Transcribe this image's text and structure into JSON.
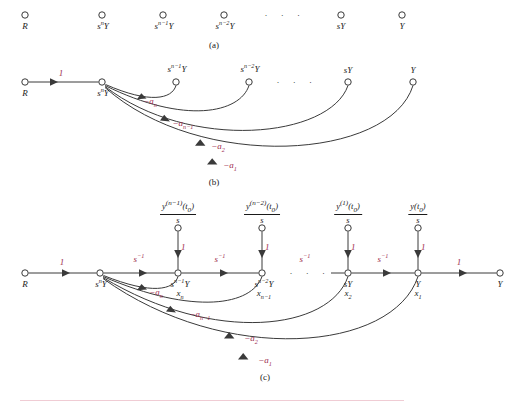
{
  "figure": {
    "title_caption_a": "(a)",
    "title_caption_b": "(b)",
    "title_caption_c": "(c)",
    "colors": {
      "ink": "#3a3a3a",
      "text": "#1a1a1a",
      "gain_red": "#9e2b4e",
      "rule_pink": "#f0ccd4"
    },
    "ellipsis": "· · ·"
  },
  "panel_a": {
    "caption": "(a)",
    "nodes": [
      {
        "id": "R",
        "label_base": "R",
        "label_sup": "",
        "label_sub": "",
        "x": 25,
        "y": 15
      },
      {
        "id": "snY",
        "label_base": "s",
        "label_sup": "n",
        "label_tail": "Y",
        "x": 102,
        "y": 15
      },
      {
        "id": "sn1Y",
        "label_base": "s",
        "label_sup": "n−1",
        "label_tail": "Y",
        "x": 163,
        "y": 15
      },
      {
        "id": "sn2Y",
        "label_base": "s",
        "label_sup": "n−2",
        "label_tail": "Y",
        "x": 224,
        "y": 15
      },
      {
        "id": "sY",
        "label_base": "sY",
        "label_sup": "",
        "label_tail": "",
        "x": 341,
        "y": 15
      },
      {
        "id": "Y",
        "label_base": "Y",
        "label_sup": "",
        "label_tail": "",
        "x": 402,
        "y": 15
      }
    ],
    "ellipsis_x": 285,
    "ellipsis_y": 13
  },
  "panel_b": {
    "caption": "(b)",
    "nodes": [
      {
        "id": "R",
        "label": "R",
        "x": 25,
        "y": 82
      },
      {
        "id": "snY",
        "label": "snY",
        "x": 102,
        "y": 82
      },
      {
        "id": "sn1Y",
        "label": "sn1Y",
        "x": 176,
        "y": 82
      },
      {
        "id": "sn2Y",
        "label": "sn2Y",
        "x": 249,
        "y": 82
      },
      {
        "id": "sY",
        "label": "sY",
        "x": 348,
        "y": 82
      },
      {
        "id": "Y",
        "label": "Y",
        "x": 413,
        "y": 82
      }
    ],
    "forward_gain": "1",
    "feedback_gains": [
      "−a",
      "−a",
      "−a",
      "−a"
    ],
    "feedback_labels": [
      {
        "base": "−a",
        "sub": "n",
        "x": 147,
        "y": 101
      },
      {
        "base": "−a",
        "sub": "n−1",
        "x": 180,
        "y": 122
      },
      {
        "base": "−a",
        "sub": "2",
        "x": 215,
        "y": 143
      },
      {
        "base": "−a",
        "sub": "1",
        "x": 226,
        "y": 162
      }
    ],
    "ellipsis_x": 297,
    "ellipsis_y": 80
  },
  "panel_c": {
    "caption": "(c)",
    "nodes": [
      {
        "id": "R",
        "x": 25,
        "y": 273,
        "label_base": "R",
        "label_sup": "",
        "label_tail": "",
        "state": ""
      },
      {
        "id": "snY",
        "x": 100,
        "y": 273,
        "label_base": "s",
        "label_sup": "n",
        "label_tail": "Y",
        "state": ""
      },
      {
        "id": "sn1Y",
        "x": 178,
        "y": 273,
        "label_base": "s",
        "label_sup": "n−1",
        "label_tail": "Y",
        "state": "x",
        "state_sub": "n"
      },
      {
        "id": "sn2Y",
        "x": 262,
        "y": 273,
        "label_base": "s",
        "label_sup": "n−2",
        "label_tail": "Y",
        "state": "x",
        "state_sub": "n−1"
      },
      {
        "id": "sY",
        "x": 348,
        "y": 273,
        "label_base": "sY",
        "label_sup": "",
        "label_tail": "",
        "state": "x",
        "state_sub": "2"
      },
      {
        "id": "Y",
        "x": 418,
        "y": 273,
        "label_base": "Y",
        "label_sup": "",
        "label_tail": "",
        "state": "x",
        "state_sub": "1"
      },
      {
        "id": "Yout",
        "x": 500,
        "y": 273,
        "label_base": "Y",
        "label_sup": "",
        "label_tail": "",
        "state": ""
      }
    ],
    "ic_sources": [
      {
        "target": "sn1Y",
        "num_base": "y",
        "num_sup": "(n−1)",
        "num_arg": "(t",
        "num_argsub": "0",
        "num_argend": ")",
        "den": "s",
        "x": 178,
        "y": 200,
        "node_y": 228,
        "gain": "1"
      },
      {
        "target": "sn2Y",
        "num_base": "y",
        "num_sup": "(n−2)",
        "num_arg": "(t",
        "num_argsub": "0",
        "num_argend": ")",
        "den": "s",
        "x": 262,
        "y": 200,
        "node_y": 228,
        "gain": "1"
      },
      {
        "target": "sY",
        "num_base": "y",
        "num_sup": "(1)",
        "num_arg": "(t",
        "num_argsub": "0",
        "num_argend": ")",
        "den": "s",
        "x": 348,
        "y": 200,
        "node_y": 228,
        "gain": "1"
      },
      {
        "target": "Y",
        "num_base": "y",
        "num_sup": "",
        "num_arg": "(t",
        "num_argsub": "0",
        "num_argend": ")",
        "den": "s",
        "x": 418,
        "y": 200,
        "node_y": 228,
        "gain": "1"
      }
    ],
    "forward_gains": [
      {
        "label": "1",
        "sup": "",
        "x": 62,
        "y": 258,
        "red": true
      },
      {
        "label": "s",
        "sup": "−1",
        "x": 139,
        "y": 256,
        "red": true
      },
      {
        "label": "s",
        "sup": "−1",
        "x": 220,
        "y": 256,
        "red": true
      },
      {
        "label": "s",
        "sup": "−1",
        "x": 305,
        "y": 256,
        "red": true
      },
      {
        "label": "s",
        "sup": "−1",
        "x": 383,
        "y": 256,
        "red": true
      },
      {
        "label": "1",
        "sup": "",
        "x": 459,
        "y": 258,
        "red": true
      }
    ],
    "ic_gain_labels": [
      {
        "label": "1",
        "x": 184,
        "y": 245
      },
      {
        "label": "1",
        "x": 268,
        "y": 245
      },
      {
        "label": "1",
        "x": 354,
        "y": 245
      },
      {
        "label": "1",
        "x": 424,
        "y": 245
      }
    ],
    "feedback_labels": [
      {
        "base": "−a",
        "sub": "n",
        "x": 152,
        "y": 291
      },
      {
        "base": "−a",
        "sub": "n−1",
        "x": 196,
        "y": 312
      },
      {
        "base": "−a",
        "sub": "2",
        "x": 248,
        "y": 336
      },
      {
        "base": "−a",
        "sub": "1",
        "x": 262,
        "y": 357
      }
    ],
    "ellipsis_x": 310,
    "ellipsis_y": 271
  }
}
